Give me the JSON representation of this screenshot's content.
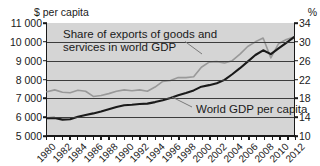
{
  "axes": {
    "left_unit": "$ per capita",
    "right_unit": "%",
    "left_ticks": [
      "11 000",
      "10 000",
      "9 000",
      "8 000",
      "7 000",
      "6 000",
      "5 000"
    ],
    "right_ticks": [
      "34",
      "30",
      "26",
      "22",
      "18",
      "14",
      "10"
    ],
    "x_labels": [
      "1980",
      "1982",
      "1984",
      "1986",
      "1988",
      "1990",
      "1992",
      "1994",
      "1996",
      "1998",
      "2000",
      "2002",
      "2004",
      "2006",
      "2008",
      "2010",
      "2012"
    ]
  },
  "annotations": {
    "exports_line1": "Share of exports of goods and",
    "exports_line2": "services in world GDP",
    "gdp": "World GDP per capita"
  },
  "colors": {
    "gdp_line": "#1a1a1a",
    "exports_line": "#999999",
    "plot_background": "#d5d5d5",
    "gridline": "#3c3c3c",
    "axis": "#1a1a1a"
  },
  "chart_data": {
    "type": "line",
    "title": "",
    "xlabel": "",
    "grid": true,
    "legend": "annotations",
    "x": [
      1980,
      1981,
      1982,
      1983,
      1984,
      1985,
      1986,
      1987,
      1988,
      1989,
      1990,
      1991,
      1992,
      1993,
      1994,
      1995,
      1996,
      1997,
      1998,
      1999,
      2000,
      2001,
      2002,
      2003,
      2004,
      2005,
      2006,
      2007,
      2008,
      2009,
      2010,
      2011,
      2012
    ],
    "series": [
      {
        "name": "World GDP per capita",
        "axis": "left",
        "ylabel": "$ per capita",
        "ylim": [
          5000,
          11000
        ],
        "unit": "$ per capita",
        "color": "#1a1a1a",
        "values": [
          5950,
          5960,
          5870,
          5890,
          6020,
          6120,
          6200,
          6300,
          6420,
          6540,
          6630,
          6660,
          6700,
          6720,
          6800,
          6900,
          7020,
          7160,
          7280,
          7420,
          7620,
          7700,
          7800,
          7980,
          8280,
          8600,
          8950,
          9300,
          9550,
          9350,
          9650,
          9950,
          10250
        ]
      },
      {
        "name": "Share of exports of goods and services in world GDP",
        "axis": "right",
        "ylabel": "%",
        "ylim": [
          10,
          34
        ],
        "unit": "%",
        "color": "#999999",
        "values": [
          19.4,
          19.8,
          19.3,
          19.2,
          19.7,
          19.5,
          18.4,
          18.6,
          19.0,
          19.5,
          19.8,
          19.6,
          19.8,
          19.5,
          20.4,
          21.6,
          21.8,
          22.4,
          22.4,
          22.6,
          24.6,
          25.7,
          25.8,
          25.5,
          26.0,
          27.4,
          29.0,
          30.0,
          30.8,
          26.6,
          29.6,
          30.5,
          31.0
        ]
      }
    ]
  }
}
